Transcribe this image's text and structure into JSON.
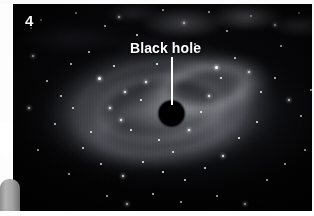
{
  "figure": {
    "panel_number": "4",
    "annotation": {
      "label": "Black hole",
      "leader_line": "vertical-white-line",
      "target": "black-hole-disc"
    },
    "colors": {
      "label_text": "#ffffff",
      "panel_number": "#f4f4f4",
      "black_hole": "#000000",
      "leader_line": "#ffffff",
      "space_background": "#050506",
      "page_background": "#fafafa",
      "grey_slab": "#a2a2a2",
      "arrow_pointer": "#ffffff"
    }
  },
  "overlay": {
    "arrow_pointer_name": "arrow-pointer-icon",
    "grey_slab_name": "grey-rounded-element"
  },
  "stars": [
    {
      "x": 28,
      "y": 16,
      "r": 1.1,
      "glow": false
    },
    {
      "x": 63,
      "y": 9,
      "r": 0.9,
      "glow": false
    },
    {
      "x": 92,
      "y": 22,
      "r": 1.0,
      "glow": false
    },
    {
      "x": 106,
      "y": 13,
      "r": 1.3,
      "glow": true
    },
    {
      "x": 124,
      "y": 31,
      "r": 0.8,
      "glow": false
    },
    {
      "x": 150,
      "y": 6,
      "r": 1.0,
      "glow": false
    },
    {
      "x": 171,
      "y": 19,
      "r": 1.2,
      "glow": true
    },
    {
      "x": 196,
      "y": 8,
      "r": 0.9,
      "glow": false
    },
    {
      "x": 214,
      "y": 27,
      "r": 1.0,
      "glow": false
    },
    {
      "x": 238,
      "y": 12,
      "r": 1.1,
      "glow": false
    },
    {
      "x": 262,
      "y": 21,
      "r": 1.3,
      "glow": true
    },
    {
      "x": 286,
      "y": 9,
      "r": 0.9,
      "glow": false
    },
    {
      "x": 300,
      "y": 33,
      "r": 1.0,
      "glow": false
    },
    {
      "x": 18,
      "y": 24,
      "r": 1.0,
      "glow": false
    },
    {
      "x": 20,
      "y": 52,
      "r": 1.2,
      "glow": true
    },
    {
      "x": 34,
      "y": 77,
      "r": 0.9,
      "glow": false
    },
    {
      "x": 16,
      "y": 104,
      "r": 1.4,
      "glow": true
    },
    {
      "x": 42,
      "y": 120,
      "r": 0.9,
      "glow": false
    },
    {
      "x": 25,
      "y": 146,
      "r": 1.0,
      "glow": false
    },
    {
      "x": 58,
      "y": 60,
      "r": 1.1,
      "glow": false
    },
    {
      "x": 76,
      "y": 48,
      "r": 0.9,
      "glow": false
    },
    {
      "x": 86,
      "y": 74,
      "r": 1.5,
      "glow": true
    },
    {
      "x": 101,
      "y": 62,
      "r": 0.9,
      "glow": false
    },
    {
      "x": 112,
      "y": 88,
      "r": 1.2,
      "glow": true
    },
    {
      "x": 97,
      "y": 104,
      "r": 1.3,
      "glow": true
    },
    {
      "x": 108,
      "y": 116,
      "r": 1.4,
      "glow": true
    },
    {
      "x": 118,
      "y": 126,
      "r": 1.0,
      "glow": false
    },
    {
      "x": 128,
      "y": 96,
      "r": 1.1,
      "glow": false
    },
    {
      "x": 133,
      "y": 78,
      "r": 1.2,
      "glow": true
    },
    {
      "x": 146,
      "y": 136,
      "r": 1.0,
      "glow": false
    },
    {
      "x": 160,
      "y": 148,
      "r": 1.1,
      "glow": false
    },
    {
      "x": 176,
      "y": 126,
      "r": 1.3,
      "glow": true
    },
    {
      "x": 188,
      "y": 108,
      "r": 1.0,
      "glow": false
    },
    {
      "x": 196,
      "y": 92,
      "r": 1.2,
      "glow": true
    },
    {
      "x": 208,
      "y": 74,
      "r": 1.0,
      "glow": false
    },
    {
      "x": 203,
      "y": 63,
      "r": 1.5,
      "glow": true
    },
    {
      "x": 222,
      "y": 54,
      "r": 1.1,
      "glow": false
    },
    {
      "x": 236,
      "y": 68,
      "r": 1.3,
      "glow": true
    },
    {
      "x": 248,
      "y": 88,
      "r": 1.0,
      "glow": false
    },
    {
      "x": 262,
      "y": 74,
      "r": 1.1,
      "glow": false
    },
    {
      "x": 276,
      "y": 96,
      "r": 1.2,
      "glow": true
    },
    {
      "x": 288,
      "y": 112,
      "r": 1.0,
      "glow": false
    },
    {
      "x": 298,
      "y": 86,
      "r": 0.9,
      "glow": false
    },
    {
      "x": 244,
      "y": 118,
      "r": 1.0,
      "glow": false
    },
    {
      "x": 226,
      "y": 134,
      "r": 1.1,
      "glow": false
    },
    {
      "x": 210,
      "y": 152,
      "r": 1.2,
      "glow": true
    },
    {
      "x": 192,
      "y": 164,
      "r": 1.0,
      "glow": false
    },
    {
      "x": 172,
      "y": 176,
      "r": 1.1,
      "glow": false
    },
    {
      "x": 150,
      "y": 168,
      "r": 0.9,
      "glow": false
    },
    {
      "x": 130,
      "y": 158,
      "r": 1.0,
      "glow": false
    },
    {
      "x": 110,
      "y": 172,
      "r": 1.2,
      "glow": true
    },
    {
      "x": 88,
      "y": 160,
      "r": 1.0,
      "glow": false
    },
    {
      "x": 70,
      "y": 144,
      "r": 1.1,
      "glow": false
    },
    {
      "x": 56,
      "y": 170,
      "r": 0.9,
      "glow": false
    },
    {
      "x": 94,
      "y": 192,
      "r": 1.0,
      "glow": false
    },
    {
      "x": 114,
      "y": 200,
      "r": 1.4,
      "glow": true
    },
    {
      "x": 140,
      "y": 190,
      "r": 0.9,
      "glow": false
    },
    {
      "x": 168,
      "y": 198,
      "r": 1.0,
      "glow": false
    },
    {
      "x": 204,
      "y": 192,
      "r": 1.1,
      "glow": false
    },
    {
      "x": 232,
      "y": 200,
      "r": 1.2,
      "glow": true
    },
    {
      "x": 254,
      "y": 176,
      "r": 1.0,
      "glow": false
    },
    {
      "x": 272,
      "y": 160,
      "r": 1.1,
      "glow": false
    },
    {
      "x": 292,
      "y": 146,
      "r": 1.0,
      "glow": false
    },
    {
      "x": 300,
      "y": 186,
      "r": 0.9,
      "glow": false
    },
    {
      "x": 268,
      "y": 42,
      "r": 1.0,
      "glow": false
    },
    {
      "x": 182,
      "y": 40,
      "r": 0.9,
      "glow": false
    },
    {
      "x": 144,
      "y": 60,
      "r": 0.9,
      "glow": false
    },
    {
      "x": 60,
      "y": 104,
      "r": 1.0,
      "glow": false
    },
    {
      "x": 48,
      "y": 92,
      "r": 0.9,
      "glow": false
    },
    {
      "x": 78,
      "y": 128,
      "r": 1.0,
      "glow": false
    }
  ]
}
